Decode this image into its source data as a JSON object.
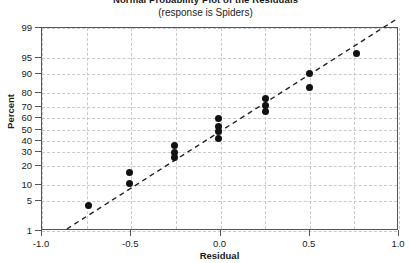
{
  "chart_data": {
    "type": "scatter",
    "title": "Normal Probability Plot of the Residuals",
    "subtitle": "(response is Spiders)",
    "xlabel": "Residual",
    "ylabel": "Percent",
    "grid": true,
    "legend": "none",
    "xlim": [
      -1.0,
      1.0
    ],
    "ylim_percent": [
      1,
      99
    ],
    "y_scale": "normal-probability",
    "xticks": [
      {
        "value": -1.0,
        "label": "-1.0"
      },
      {
        "value": -0.5,
        "label": "-0.5"
      },
      {
        "value": 0.0,
        "label": "0.0"
      },
      {
        "value": 0.5,
        "label": "0.5"
      },
      {
        "value": 1.0,
        "label": "1.0"
      }
    ],
    "yticks": [
      {
        "value": 1,
        "label": "1"
      },
      {
        "value": 5,
        "label": "5"
      },
      {
        "value": 10,
        "label": "10"
      },
      {
        "value": 20,
        "label": "20"
      },
      {
        "value": 30,
        "label": "30"
      },
      {
        "value": 40,
        "label": "40"
      },
      {
        "value": 50,
        "label": "50"
      },
      {
        "value": 60,
        "label": "60"
      },
      {
        "value": 70,
        "label": "70"
      },
      {
        "value": 80,
        "label": "80"
      },
      {
        "value": 90,
        "label": "90"
      },
      {
        "value": 95,
        "label": "95"
      },
      {
        "value": 99,
        "label": "99"
      }
    ],
    "series": [
      {
        "name": "Residuals",
        "marker": "filled-circle",
        "color": "#111111",
        "points": [
          {
            "x": -0.74,
            "percent": 4
          },
          {
            "x": -0.51,
            "percent": 16
          },
          {
            "x": -0.51,
            "percent": 11
          },
          {
            "x": -0.26,
            "percent": 36
          },
          {
            "x": -0.26,
            "percent": 30
          },
          {
            "x": -0.26,
            "percent": 26
          },
          {
            "x": -0.01,
            "percent": 60
          },
          {
            "x": -0.01,
            "percent": 53
          },
          {
            "x": -0.01,
            "percent": 48
          },
          {
            "x": -0.01,
            "percent": 42
          },
          {
            "x": 0.25,
            "percent": 76
          },
          {
            "x": 0.25,
            "percent": 71
          },
          {
            "x": 0.25,
            "percent": 66
          },
          {
            "x": 0.5,
            "percent": 90
          },
          {
            "x": 0.5,
            "percent": 83
          },
          {
            "x": 0.76,
            "percent": 96
          }
        ]
      }
    ],
    "fit_line": {
      "name": "Normal reference line",
      "style": "dashed",
      "color": "#222222",
      "x_start": -0.86,
      "percent_start": 1.0,
      "x_end": 0.99,
      "percent_end": 99.4
    },
    "colors": {
      "frame": "#555555",
      "grid": "#c9c9cf",
      "marker": "#111111",
      "line": "#222222",
      "background": "#ffffff",
      "text": "#1a1a1a"
    }
  }
}
